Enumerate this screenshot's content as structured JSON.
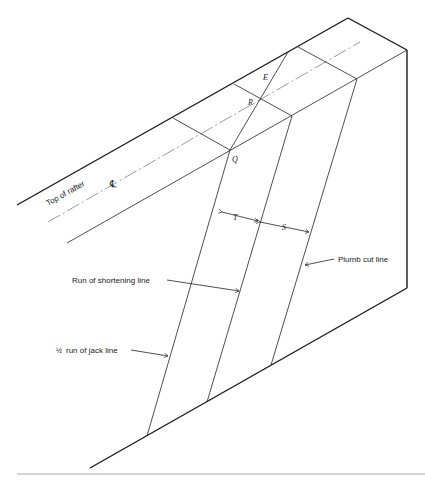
{
  "figure": {
    "labels": {
      "top_of_rafter": "Top of rafter",
      "centerline_symbol": "℄",
      "run_of_shortening_line": "Run of shortening line",
      "plumb_cut_line": "Plumb cut line",
      "half_run_of_jack_line_fraction": "½",
      "half_run_of_jack_line": "run of jack line"
    },
    "points": {
      "E": "E",
      "R": "R",
      "Q": "Q"
    },
    "dimensions": {
      "T": "T",
      "S": "S"
    }
  }
}
